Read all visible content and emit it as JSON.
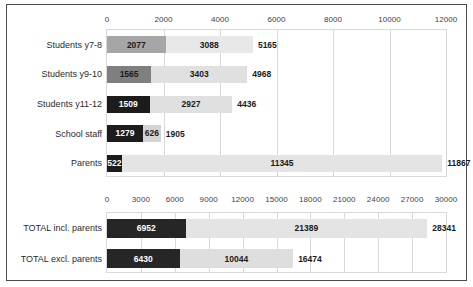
{
  "chart_data": [
    {
      "id": "top-chart",
      "type": "bar",
      "orientation": "horizontal",
      "stacked": true,
      "title": "",
      "xlabel": "",
      "ylabel": "",
      "xlim": [
        0,
        12000
      ],
      "xtick_step": 2000,
      "xticks": [
        "0",
        "2000",
        "4000",
        "6000",
        "8000",
        "10000",
        "12000"
      ],
      "grid": true,
      "legend": "none",
      "categories": [
        "Students y7-8",
        "Students y9-10",
        "Students y11-12",
        "School staff",
        "Parents"
      ],
      "series": [
        {
          "name": "segment-1",
          "values": [
            2077,
            1565,
            1509,
            1279,
            522
          ],
          "labels": [
            "2077",
            "1565",
            "1509",
            "1279",
            "522"
          ],
          "colors": [
            "#a6a6a6",
            "#7f7f7f",
            "#1c1c1c",
            "#1c1c1c",
            "#1c1c1c"
          ]
        },
        {
          "name": "segment-2",
          "values": [
            3088,
            3403,
            2927,
            626,
            11345
          ],
          "labels": [
            "3088",
            "3403",
            "2927",
            "626",
            "11345"
          ],
          "colors": [
            "#e8e8e8",
            "#e0e0e0",
            "#e0e0e0",
            "#d4d4d4",
            "#e4e4e4"
          ]
        }
      ],
      "totals": [
        5165,
        4968,
        4436,
        1905,
        11867
      ],
      "total_labels": [
        "5165",
        "4968",
        "4436",
        "1905",
        "11867"
      ]
    },
    {
      "id": "bottom-chart",
      "type": "bar",
      "orientation": "horizontal",
      "stacked": true,
      "title": "",
      "xlabel": "",
      "ylabel": "",
      "xlim": [
        0,
        30000
      ],
      "xtick_step": 3000,
      "xticks": [
        "0",
        "3000",
        "6000",
        "9000",
        "12000",
        "15000",
        "18000",
        "21000",
        "24000",
        "27000",
        "30000"
      ],
      "grid": true,
      "legend": "none",
      "categories": [
        "TOTAL incl. parents",
        "TOTAL excl. parents"
      ],
      "series": [
        {
          "name": "segment-1",
          "values": [
            6952,
            6430
          ],
          "labels": [
            "6952",
            "6430"
          ],
          "colors": [
            "#262626",
            "#262626"
          ]
        },
        {
          "name": "segment-2",
          "values": [
            21389,
            10044
          ],
          "labels": [
            "21389",
            "10044"
          ],
          "colors": [
            "#e4e4e4",
            "#dedede"
          ]
        }
      ],
      "totals": [
        28341,
        16474
      ],
      "total_labels": [
        "28341",
        "16474"
      ]
    }
  ]
}
